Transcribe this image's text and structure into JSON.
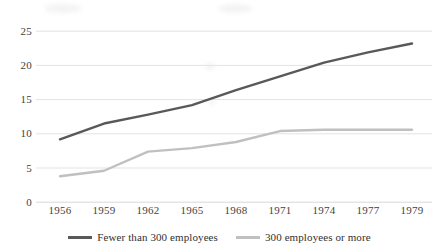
{
  "chart_data": {
    "type": "line",
    "title": "",
    "subtitle": "",
    "xlabel": "",
    "ylabel": "",
    "x": [
      1956,
      1959,
      1962,
      1965,
      1968,
      1971,
      1974,
      1977,
      1979
    ],
    "categories": [
      "1956",
      "1959",
      "1962",
      "1965",
      "1968",
      "1971",
      "1974",
      "1977",
      "1979"
    ],
    "series": [
      {
        "name": "Fewer than 300 employees",
        "color": "#595959",
        "values": [
          9.2,
          11.5,
          12.8,
          14.2,
          16.4,
          18.4,
          20.4,
          21.9,
          23.2
        ]
      },
      {
        "name": "300 employees or more",
        "color": "#c0c0c0",
        "values": [
          3.8,
          4.6,
          7.4,
          7.9,
          8.8,
          10.4,
          10.6,
          10.6,
          10.6
        ]
      }
    ],
    "ylim": [
      0,
      25
    ],
    "yticks": [
      0,
      5,
      10,
      15,
      20,
      25
    ],
    "ytick_labels": [
      "0",
      "5",
      "10",
      "15",
      "20",
      "25"
    ],
    "xtick_labels": [
      "1956",
      "1959",
      "1962",
      "1965",
      "1968",
      "1971",
      "1974",
      "1977",
      "1979"
    ],
    "grid": "horizontal",
    "legend_position": "bottom"
  },
  "legend": {
    "entries": [
      {
        "label": "Fewer than 300 employees"
      },
      {
        "label": "300 employees or more"
      }
    ]
  },
  "axes": {
    "y_labels": [
      "25",
      "20",
      "15",
      "10",
      "5",
      "0"
    ],
    "x_labels": [
      "1956",
      "1959",
      "1962",
      "1965",
      "1968",
      "1971",
      "1974",
      "1977",
      "1979"
    ]
  },
  "colors": {
    "series_a": "#595959",
    "series_b": "#c0c0c0",
    "gridline": "#e3e3e3",
    "text": "#3f3f3f",
    "background": "#ffffff"
  }
}
